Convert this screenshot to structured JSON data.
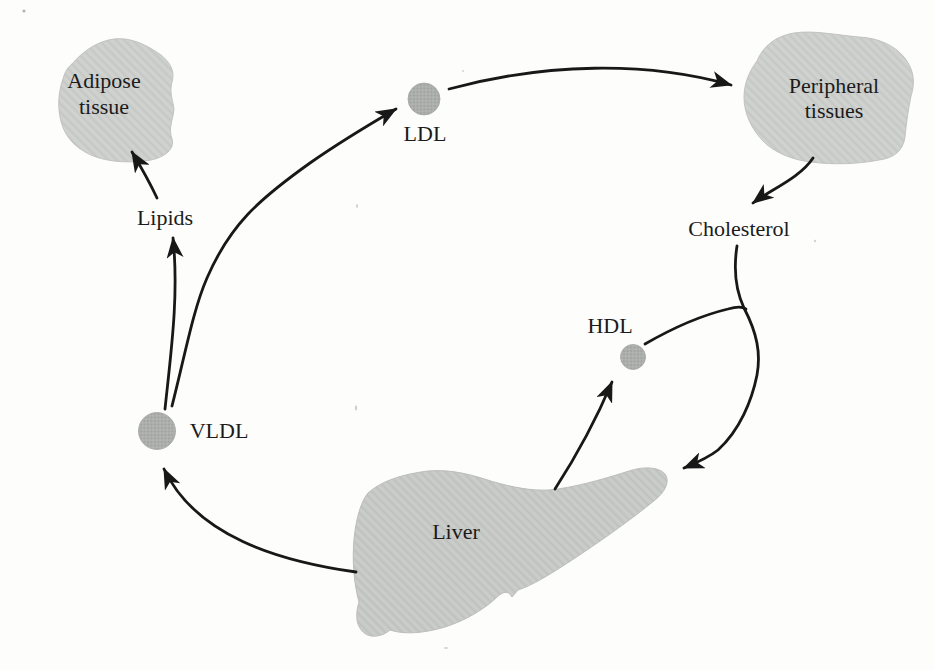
{
  "figure": {
    "kind": "metabolic-pathway-diagram",
    "colors": {
      "background": "#fdfdfc",
      "line": "#181818",
      "text": "#1b1b1b",
      "tissue_fill": "#cdcfcd",
      "organ_fill": "#c7c9c7",
      "particle_fill": "#adafad"
    },
    "nodes": {
      "adipose": {
        "kind": "tissue-blob",
        "label": "Adipose tissue",
        "lines": [
          "Adipose",
          "tissue"
        ]
      },
      "peripheral": {
        "kind": "tissue-blob",
        "label": "Peripheral tissues",
        "lines": [
          "Peripheral",
          "tissues"
        ]
      },
      "liver": {
        "kind": "organ-blob",
        "label": "Liver"
      },
      "vldl": {
        "kind": "lipoprotein-particle",
        "label": "VLDL"
      },
      "ldl": {
        "kind": "lipoprotein-particle",
        "label": "LDL"
      },
      "hdl": {
        "kind": "lipoprotein-particle",
        "label": "HDL"
      },
      "lipids": {
        "kind": "metabolite-text",
        "label": "Lipids"
      },
      "cholesterol": {
        "kind": "metabolite-text",
        "label": "Cholesterol"
      }
    },
    "edges": [
      {
        "from": "Liver",
        "to": "VLDL",
        "arrowhead": true
      },
      {
        "from": "VLDL",
        "to": "Lipids",
        "arrowhead": true
      },
      {
        "from": "Lipids",
        "to": "Adipose tissue",
        "arrowhead": true
      },
      {
        "from": "VLDL",
        "to": "LDL",
        "arrowhead": true
      },
      {
        "from": "LDL",
        "to": "Peripheral tissues",
        "arrowhead": true
      },
      {
        "from": "Peripheral tissues",
        "to": "Cholesterol",
        "arrowhead": true
      },
      {
        "from": "Cholesterol",
        "to": "Liver",
        "arrowhead": true
      },
      {
        "from": "Liver",
        "to": "HDL",
        "arrowhead": true
      },
      {
        "from": "HDL",
        "to": "Cholesterol-to-Liver path",
        "arrowhead": false
      }
    ]
  }
}
